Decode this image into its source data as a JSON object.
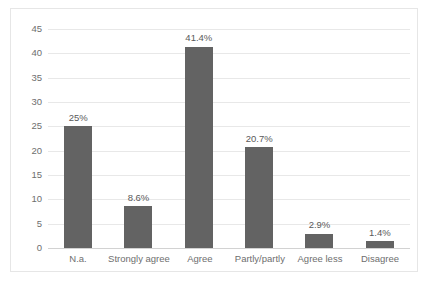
{
  "chart_data": {
    "type": "bar",
    "title": "",
    "subtitle": "",
    "xlabel": "",
    "ylabel": "",
    "categories": [
      "N.a.",
      "Strongly agree",
      "Agree",
      "Partly/partly",
      "Agree less",
      "Disagree"
    ],
    "values": [
      25,
      8.6,
      41.4,
      20.7,
      2.9,
      1.4
    ],
    "data_labels": [
      "25%",
      "8.6%",
      "41.4%",
      "20.7%",
      "2.9%",
      "1.4%"
    ],
    "series": [
      {
        "name": "",
        "values": [
          25,
          8.6,
          41.4,
          20.7,
          2.9,
          1.4
        ]
      }
    ],
    "ylim": [
      0,
      45
    ],
    "ytick_values": [
      0,
      5,
      10,
      15,
      20,
      25,
      30,
      35,
      40,
      45
    ],
    "ytick_labels": [
      "0",
      "5",
      "10",
      "15",
      "20",
      "25",
      "30",
      "35",
      "40",
      "45"
    ],
    "grid": true,
    "grid_axis": "y",
    "legend": false,
    "legend_position": "none",
    "bar_color": "#636363",
    "gridline_color": "#e8e8e8",
    "axis_text_color": "#6e6e6e",
    "label_text_color": "#5a5a5a",
    "plot_border_color": "#e6e6e6",
    "background_color": "#ffffff"
  }
}
